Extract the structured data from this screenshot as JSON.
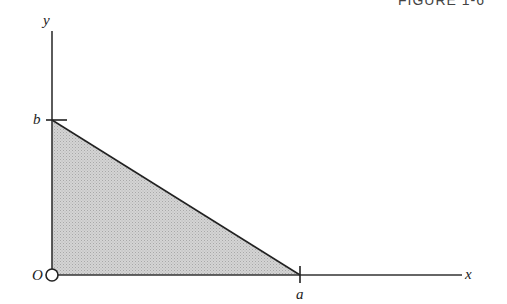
{
  "figure": {
    "heading": "FIGURE 1-6",
    "labels": {
      "y_axis": "y",
      "x_axis": "x",
      "origin": "O",
      "y_intercept": "b",
      "x_intercept": "a"
    },
    "colors": {
      "axis": "#333333",
      "region_fill": "#c8c8c8",
      "hypotenuse": "#222222"
    },
    "shape": {
      "type": "right-triangle-region",
      "vertices": [
        "O (0,0)",
        "a (a,0)",
        "b (0,b)"
      ],
      "shaded": true
    }
  }
}
